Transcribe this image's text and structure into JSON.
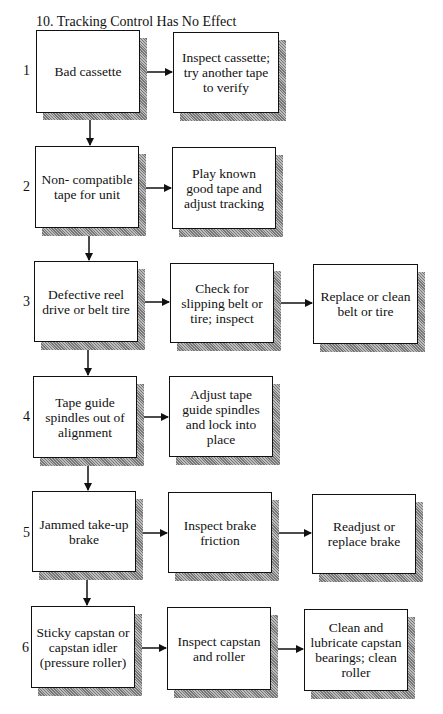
{
  "title": "10. Tracking Control Has No Effect",
  "rows": [
    {
      "number": "1",
      "cause": "Bad cassette",
      "steps": [
        "Inspect cassette; try another tape to verify"
      ]
    },
    {
      "number": "2",
      "cause": "Non- compatible tape for unit",
      "steps": [
        "Play known good tape and adjust tracking"
      ]
    },
    {
      "number": "3",
      "cause": "Defective reel drive or belt tire",
      "steps": [
        "Check for slipping belt or tire; inspect",
        "Replace or clean belt or tire"
      ]
    },
    {
      "number": "4",
      "cause": "Tape guide spindles out of alignment",
      "steps": [
        "Adjust tape guide spindles and lock into place"
      ]
    },
    {
      "number": "5",
      "cause": "Jammed take-up brake",
      "steps": [
        "Inspect brake friction",
        "Readjust or replace brake"
      ]
    },
    {
      "number": "6",
      "cause": "Sticky capstan or capstan idler (pressure roller)",
      "steps": [
        "Inspect capstan and roller",
        "Clean and lubricate capstan bearings; clean roller"
      ]
    }
  ],
  "colors": {
    "line": "#111111",
    "shadow": "#9a9a9a",
    "background": "#ffffff"
  }
}
